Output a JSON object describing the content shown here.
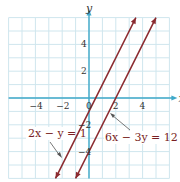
{
  "chart_data": {
    "type": "line",
    "title": "",
    "xlabel": "x",
    "ylabel": "y",
    "xlim": [
      -6,
      6
    ],
    "ylim": [
      -6,
      6
    ],
    "grid": true,
    "x_ticks": [
      "−4",
      "−2",
      "0",
      "2",
      "4"
    ],
    "y_ticks": [
      "4",
      "2",
      "−2",
      "−4"
    ],
    "series": [
      {
        "name": "2x − y = 1",
        "equation": "y = 2x - 1",
        "slope": 2,
        "intercept": -1,
        "x": [
          -2.5,
          3.5
        ],
        "y": [
          -6,
          6
        ]
      },
      {
        "name": "6x − 3y = 12",
        "equation": "y = 2x - 4",
        "slope": 2,
        "intercept": -4,
        "x": [
          -1,
          5
        ],
        "y": [
          -6,
          6
        ]
      }
    ],
    "annotations": [
      "2x − y = 1",
      "6x − 3y = 12"
    ],
    "colors": {
      "lines": "#8b2a2f",
      "axes": "#3fa9c9",
      "grid": "#cfe6ee"
    }
  }
}
